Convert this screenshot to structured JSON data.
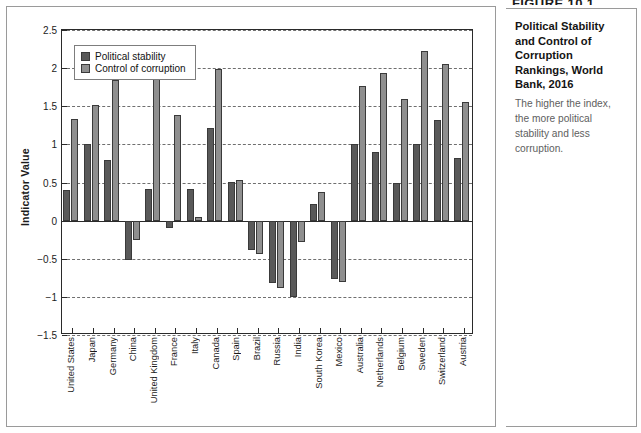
{
  "figure": {
    "header": "FIGURE 10.1",
    "title": "Political Stability and Control of Corruption Rankings, World Bank, 2016",
    "caption": "The higher the index, the more political stability and less corruption."
  },
  "legend": {
    "items": [
      {
        "label": "Political stability",
        "color": "#595959",
        "key": "political_stability"
      },
      {
        "label": "Control of corruption",
        "color": "#8f8f8f",
        "key": "control_of_corruption"
      }
    ]
  },
  "axes": {
    "ylabel": "Indicator Value",
    "yticks": [
      "2.5",
      "2",
      "1.5",
      "1",
      "0.5",
      "0",
      "-0.5",
      "-1",
      "-1.5"
    ],
    "ymin": -1.5,
    "ymax": 2.5
  },
  "chart_data": {
    "type": "bar",
    "title": "Political Stability and Control of Corruption Rankings, World Bank, 2016",
    "xlabel": "",
    "ylabel": "Indicator Value",
    "ylim": [
      -1.5,
      2.5
    ],
    "ytick_step": 0.5,
    "grid": true,
    "legend_position": "top-left-inside",
    "categories": [
      "United States",
      "Japan",
      "Germany",
      "China",
      "United Kingdom",
      "France",
      "Italy",
      "Canada",
      "Spain",
      "Brazil",
      "Russia",
      "India",
      "South Korea",
      "Mexico",
      "Australia",
      "Netherlands",
      "Belgium",
      "Sweden",
      "Switzerland",
      "Austria"
    ],
    "series": [
      {
        "name": "Political stability",
        "color": "#595959",
        "values": [
          0.4,
          1.0,
          0.8,
          -0.52,
          0.42,
          -0.1,
          0.42,
          1.22,
          0.51,
          -0.38,
          -0.82,
          -1.0,
          0.22,
          -0.76,
          1.0,
          0.9,
          0.5,
          1.0,
          1.32,
          0.82
        ]
      },
      {
        "name": "Control of corruption",
        "color": "#8f8f8f",
        "values": [
          1.33,
          1.51,
          1.84,
          -0.25,
          1.89,
          1.38,
          0.05,
          1.99,
          0.53,
          -0.44,
          -0.88,
          -0.28,
          0.38,
          -0.8,
          1.77,
          1.94,
          1.6,
          2.22,
          2.06,
          1.55
        ]
      }
    ]
  }
}
